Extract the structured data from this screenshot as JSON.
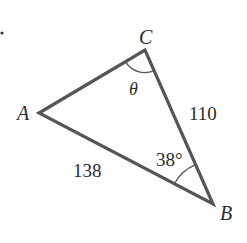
{
  "diagram": {
    "type": "triangle",
    "vertices": {
      "A": {
        "label": "A",
        "x": 39,
        "y": 113
      },
      "B": {
        "label": "B",
        "x": 213,
        "y": 204
      },
      "C": {
        "label": "C",
        "x": 145,
        "y": 50
      }
    },
    "sides": {
      "AB": {
        "label": "138"
      },
      "BC": {
        "label": "110"
      }
    },
    "angles": {
      "C": {
        "label": "θ"
      },
      "B": {
        "label": "38°"
      }
    },
    "colors": {
      "stroke": "#555555",
      "text": "#2b2b2b"
    }
  }
}
